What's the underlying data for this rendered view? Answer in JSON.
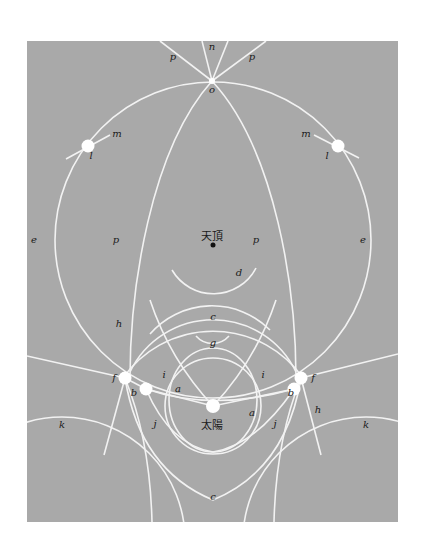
{
  "diagram": {
    "type": "halo-phenomena-diagram",
    "background_color": "#a9a9a9",
    "line_color": "#f2f2f2",
    "center_labels": {
      "zenith": "天頂",
      "sun": "太陽"
    },
    "labels": {
      "a_left": "a",
      "a_right": "a",
      "b_left": "b",
      "b_right": "b",
      "c_upper": "c",
      "c_lower": "c",
      "d": "d",
      "e_left": "e",
      "e_right": "e",
      "f_left": "f",
      "f_right": "f",
      "g": "g",
      "h_left": "h",
      "h_right": "h",
      "i_left": "i",
      "i_right": "i",
      "j_left": "j",
      "j_right": "j",
      "k_left": "k",
      "k_right": "k",
      "l_left": "l",
      "l_right": "l",
      "m_left": "m",
      "m_right": "m",
      "n": "n",
      "o": "o",
      "p_top_left": "p",
      "p_top_right": "p",
      "p_mid_left": "p",
      "p_mid_right": "p"
    }
  }
}
